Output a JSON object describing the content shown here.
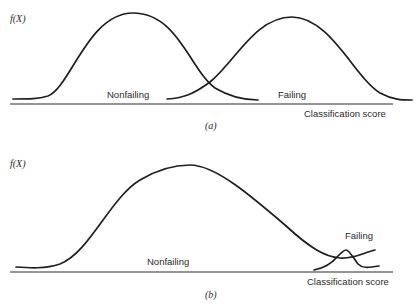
{
  "panel_a": {
    "ylabel": "f(X)",
    "xlabel": "Classification score",
    "caption": "(a)",
    "series": [
      {
        "name": "Nonfailing",
        "label": "Nonfailing"
      },
      {
        "name": "Failing",
        "label": "Failing"
      }
    ]
  },
  "panel_b": {
    "ylabel": "f(X)",
    "xlabel": "Classification score",
    "caption": "(b)",
    "series": [
      {
        "name": "Nonfailing",
        "label": "Nonfailing"
      },
      {
        "name": "Failing",
        "label": "Failing"
      }
    ]
  },
  "colors": {
    "line": "#1e1e1e",
    "text": "#2a2a2a",
    "background": "#ffffff"
  }
}
